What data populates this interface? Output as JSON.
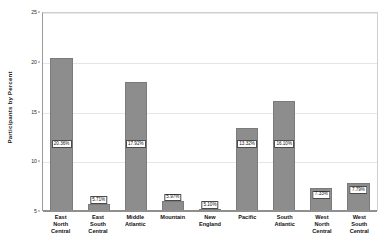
{
  "chart_data": {
    "type": "bar",
    "title": "",
    "subtitle": "",
    "xlabel": "",
    "ylabel": "Participants by Percent",
    "ylim": [
      5,
      25
    ],
    "yticks": [
      5,
      10,
      15,
      20,
      25
    ],
    "ytick_labels": [
      "5",
      "10",
      "15",
      "20",
      "25"
    ],
    "grid": true,
    "legend": "none",
    "bar_color": "#8d8d8d",
    "bar_edge_color": "#7b7b7b",
    "label_box_color": "#ffffff",
    "label_border_color": "#4a4a4a",
    "categories": [
      "East North Central",
      "East South Central",
      "Middle Atlantic",
      "Mountain",
      "New England",
      "Pacific",
      "South Atlantic",
      "West North Central",
      "West South Central"
    ],
    "category_lines": [
      [
        "East",
        "North",
        "Central"
      ],
      [
        "East",
        "South",
        "Central"
      ],
      [
        "Middle",
        "Atlantic"
      ],
      [
        "Mountain"
      ],
      [
        "New",
        "England"
      ],
      [
        "Pacific"
      ],
      [
        "South",
        "Atlantic"
      ],
      [
        "West",
        "North",
        "Central"
      ],
      [
        "West",
        "South",
        "Central"
      ]
    ],
    "values": [
      20.36,
      5.71,
      17.92,
      5.97,
      5.1,
      13.32,
      16.1,
      7.33,
      7.79
    ],
    "data_labels": [
      "20.36%",
      "5.71%",
      "17.92%",
      "5.97%",
      "5.10%",
      "13.32%",
      "16.10%",
      "7.33%",
      "7.79%"
    ],
    "label_placement": [
      "inside",
      "outside",
      "inside",
      "outside",
      "outside",
      "inside",
      "inside",
      "inside",
      "inside"
    ]
  }
}
